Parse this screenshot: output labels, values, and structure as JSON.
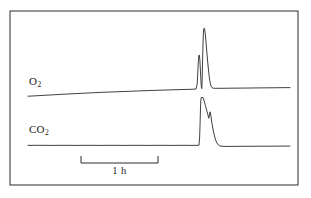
{
  "figure": {
    "background_color": "#ffffff",
    "frame": {
      "x": 10,
      "y": 11,
      "width": 288,
      "height": 174,
      "stroke_color": "#2b2b2b",
      "stroke_width": 1
    }
  },
  "labels": {
    "o2": {
      "base": "O",
      "subscript": "2"
    },
    "co2": {
      "base": "CO",
      "subscript": "2"
    }
  },
  "scalebar": {
    "label": "1 h",
    "x_start": 81,
    "x_end": 158,
    "y": 163,
    "tick_height": 7,
    "stroke_color": "#2b2b2b"
  },
  "chart_data": {
    "type": "line",
    "title": "",
    "subtitle": "",
    "xlabel": "",
    "ylabel": "",
    "grid": false,
    "legend_position": "inline-left",
    "axis_visible": false,
    "annotations": [
      {
        "text": "O2",
        "target_series": "O2",
        "position": "left-above-trace"
      },
      {
        "text": "CO2",
        "target_series": "CO2",
        "position": "left-above-trace"
      },
      {
        "text": "1 h",
        "type": "scale-bar",
        "span_hours": 1
      }
    ],
    "x": {
      "unit": "hours",
      "scale_bar_hours": 1,
      "scale_bar_pixels": 77,
      "trace_start_px": 28,
      "trace_end_px": 290,
      "total_span_hours": 3.4
    },
    "ylim_px": [
      11,
      185
    ],
    "series": [
      {
        "name": "O2",
        "color": "#2b2b2b",
        "stroke_width": 0.9,
        "description": "Slowly rising oxygen baseline interrupted by a sharp double-topped spike, settling to a slightly elevated plateau",
        "points_px": [
          [
            28,
            96.2
          ],
          [
            36,
            95.8
          ],
          [
            44,
            95.3
          ],
          [
            52,
            94.9
          ],
          [
            60,
            94.4
          ],
          [
            68,
            94.0
          ],
          [
            76,
            93.6
          ],
          [
            84,
            93.2
          ],
          [
            92,
            92.8
          ],
          [
            100,
            92.4
          ],
          [
            108,
            92.1
          ],
          [
            116,
            91.8
          ],
          [
            124,
            91.5
          ],
          [
            132,
            91.2
          ],
          [
            140,
            90.9
          ],
          [
            148,
            90.6
          ],
          [
            156,
            90.3
          ],
          [
            164,
            90.1
          ],
          [
            172,
            89.8
          ],
          [
            180,
            89.6
          ],
          [
            188,
            89.4
          ],
          [
            193,
            89.2
          ],
          [
            196,
            89.0
          ],
          [
            197.2,
            84.0
          ],
          [
            197.8,
            72.0
          ],
          [
            198.3,
            62.0
          ],
          [
            198.8,
            56.0
          ],
          [
            199.3,
            55.0
          ],
          [
            199.9,
            60.0
          ],
          [
            200.4,
            70.0
          ],
          [
            200.9,
            80.0
          ],
          [
            201.3,
            86.5
          ],
          [
            201.8,
            88.6
          ],
          [
            202.2,
            78.0
          ],
          [
            202.6,
            60.0
          ],
          [
            203.0,
            44.0
          ],
          [
            203.4,
            33.0
          ],
          [
            203.8,
            28.6
          ],
          [
            204.3,
            28.2
          ],
          [
            204.8,
            30.0
          ],
          [
            205.4,
            35.0
          ],
          [
            206.2,
            44.0
          ],
          [
            207.0,
            54.0
          ],
          [
            207.8,
            63.0
          ],
          [
            208.6,
            71.0
          ],
          [
            209.4,
            78.0
          ],
          [
            210.2,
            83.0
          ],
          [
            211.0,
            86.0
          ],
          [
            212.0,
            87.6
          ],
          [
            213.2,
            88.2
          ],
          [
            215.0,
            88.3
          ],
          [
            220,
            88.3
          ],
          [
            230,
            88.2
          ],
          [
            240,
            88.1
          ],
          [
            250,
            88.0
          ],
          [
            260,
            87.9
          ],
          [
            270,
            87.8
          ],
          [
            280,
            87.7
          ],
          [
            290,
            87.6
          ]
        ]
      },
      {
        "name": "CO2",
        "color": "#2b2b2b",
        "stroke_width": 0.9,
        "description": "Flat carbon dioxide baseline with an abrupt vertical step up, a notched jagged decay, and return to baseline",
        "points_px": [
          [
            28,
            145.4
          ],
          [
            40,
            145.3
          ],
          [
            52,
            145.4
          ],
          [
            64,
            145.3
          ],
          [
            76,
            145.4
          ],
          [
            88,
            145.3
          ],
          [
            100,
            145.4
          ],
          [
            112,
            145.3
          ],
          [
            124,
            145.4
          ],
          [
            136,
            145.3
          ],
          [
            148,
            145.4
          ],
          [
            160,
            145.3
          ],
          [
            172,
            145.4
          ],
          [
            184,
            145.3
          ],
          [
            192,
            145.4
          ],
          [
            197,
            145.3
          ],
          [
            199,
            145.2
          ],
          [
            199.6,
            138.0
          ],
          [
            200.0,
            126.0
          ],
          [
            200.4,
            112.0
          ],
          [
            200.8,
            101.0
          ],
          [
            201.2,
            97.6
          ],
          [
            202.0,
            97.4
          ],
          [
            203.0,
            97.6
          ],
          [
            204.2,
            101.0
          ],
          [
            205.4,
            105.5
          ],
          [
            206.6,
            110.0
          ],
          [
            207.8,
            114.5
          ],
          [
            208.8,
            118.2
          ],
          [
            209.6,
            114.0
          ],
          [
            210.2,
            111.8
          ],
          [
            210.9,
            116.0
          ],
          [
            211.6,
            121.0
          ],
          [
            212.6,
            127.0
          ],
          [
            213.8,
            133.0
          ],
          [
            215.0,
            138.0
          ],
          [
            216.4,
            142.0
          ],
          [
            217.8,
            144.4
          ],
          [
            219.4,
            145.6
          ],
          [
            221.0,
            146.1
          ],
          [
            223.0,
            146.3
          ],
          [
            226,
            146.4
          ],
          [
            232,
            146.4
          ],
          [
            240,
            146.3
          ],
          [
            250,
            146.3
          ],
          [
            260,
            146.2
          ],
          [
            270,
            146.2
          ],
          [
            280,
            146.1
          ],
          [
            290,
            146.1
          ]
        ]
      }
    ]
  }
}
